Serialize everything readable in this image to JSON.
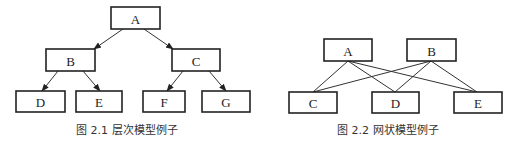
{
  "figures": [
    {
      "id": "fig-2-1",
      "caption_number": "图 2.1",
      "caption_title": "层次模型例子",
      "caption_x": 76,
      "caption_y": 130,
      "title_offset": 36,
      "arrowheads": true,
      "nodes": [
        {
          "id": "A",
          "label": "A",
          "x": 111,
          "y": 7,
          "w": 49,
          "h": 22
        },
        {
          "id": "B",
          "label": "B",
          "x": 46,
          "y": 49,
          "w": 49,
          "h": 22
        },
        {
          "id": "C",
          "label": "C",
          "x": 172,
          "y": 49,
          "w": 48,
          "h": 22
        },
        {
          "id": "D",
          "label": "D",
          "x": 16,
          "y": 91,
          "w": 49,
          "h": 21
        },
        {
          "id": "E",
          "label": "E",
          "x": 76,
          "y": 91,
          "w": 46,
          "h": 21
        },
        {
          "id": "F",
          "label": "F",
          "x": 143,
          "y": 91,
          "w": 42,
          "h": 21
        },
        {
          "id": "G",
          "label": "G",
          "x": 202,
          "y": 91,
          "w": 48,
          "h": 21
        }
      ],
      "edges": [
        {
          "from": "A",
          "to": "B",
          "x1": 123,
          "y1": 29,
          "x2": 94,
          "y2": 49
        },
        {
          "from": "A",
          "to": "C",
          "x1": 144,
          "y1": 29,
          "x2": 173,
          "y2": 49
        },
        {
          "from": "B",
          "to": "D",
          "x1": 58,
          "y1": 71,
          "x2": 42,
          "y2": 91
        },
        {
          "from": "B",
          "to": "E",
          "x1": 83,
          "y1": 71,
          "x2": 100,
          "y2": 91
        },
        {
          "from": "C",
          "to": "F",
          "x1": 183,
          "y1": 71,
          "x2": 167,
          "y2": 91
        },
        {
          "from": "C",
          "to": "G",
          "x1": 209,
          "y1": 71,
          "x2": 226,
          "y2": 91
        }
      ]
    },
    {
      "id": "fig-2-2",
      "caption_number": "图 2.2",
      "caption_title": "网状模型例子",
      "caption_x": 337,
      "caption_y": 130,
      "title_offset": 36,
      "arrowheads": false,
      "nodes": [
        {
          "id": "A",
          "label": "A",
          "x": 324,
          "y": 39,
          "w": 48,
          "h": 22
        },
        {
          "id": "B",
          "label": "B",
          "x": 407,
          "y": 39,
          "w": 49,
          "h": 22
        },
        {
          "id": "C",
          "label": "C",
          "x": 289,
          "y": 92,
          "w": 48,
          "h": 21
        },
        {
          "id": "D",
          "label": "D",
          "x": 372,
          "y": 92,
          "w": 47,
          "h": 21
        },
        {
          "id": "E",
          "label": "E",
          "x": 454,
          "y": 92,
          "w": 48,
          "h": 21
        }
      ],
      "edges": [
        {
          "from": "A",
          "to": "C",
          "x1": 348,
          "y1": 61,
          "x2": 313,
          "y2": 92
        },
        {
          "from": "A",
          "to": "D",
          "x1": 348,
          "y1": 61,
          "x2": 395,
          "y2": 92
        },
        {
          "from": "A",
          "to": "E",
          "x1": 348,
          "y1": 61,
          "x2": 477,
          "y2": 92
        },
        {
          "from": "B",
          "to": "C",
          "x1": 431,
          "y1": 61,
          "x2": 313,
          "y2": 92
        },
        {
          "from": "B",
          "to": "D",
          "x1": 431,
          "y1": 61,
          "x2": 395,
          "y2": 92
        },
        {
          "from": "B",
          "to": "E",
          "x1": 431,
          "y1": 61,
          "x2": 477,
          "y2": 92
        }
      ]
    }
  ]
}
